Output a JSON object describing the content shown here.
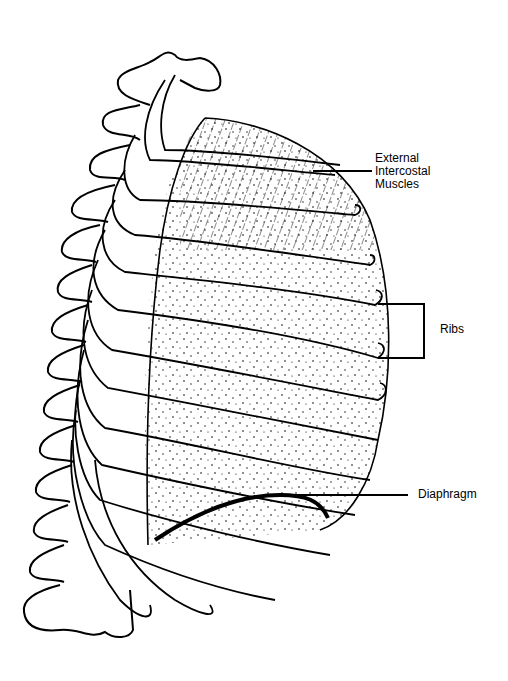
{
  "figure": {
    "type": "anatomical line drawing",
    "ink_color": "#000000",
    "background_color": "#ffffff"
  },
  "labels": {
    "external_intercostal_line1": "External",
    "external_intercostal_line2": "Intercostal",
    "external_intercostal_line3": "Muscles",
    "ribs": "Ribs",
    "diaphragm": "Diaphragm"
  }
}
